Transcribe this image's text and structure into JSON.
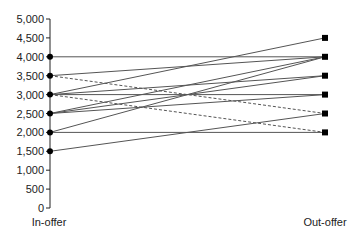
{
  "chart_data": {
    "type": "line",
    "title": "",
    "xlabel": "",
    "ylabel": "",
    "categories": [
      "In-offer",
      "Out-offer"
    ],
    "ylim": [
      0,
      5000
    ],
    "yticks": [
      0,
      500,
      1000,
      1500,
      2000,
      2500,
      3000,
      3500,
      4000,
      4500,
      5000
    ],
    "ytick_labels": [
      "0",
      "500",
      "1,000",
      "1,500",
      "2,000",
      "2,500",
      "3,000",
      "3,500",
      "4,000",
      "4,500",
      "5,000"
    ],
    "grid": false,
    "legend": null,
    "series": [
      {
        "name": "1",
        "values": [
          4000,
          4000
        ],
        "style": "solid"
      },
      {
        "name": "2",
        "values": [
          3500,
          4000
        ],
        "style": "solid"
      },
      {
        "name": "3",
        "values": [
          3500,
          2500
        ],
        "style": "dashed"
      },
      {
        "name": "4",
        "values": [
          3000,
          4500
        ],
        "style": "solid"
      },
      {
        "name": "5",
        "values": [
          3000,
          3500
        ],
        "style": "solid"
      },
      {
        "name": "6",
        "values": [
          3000,
          3000
        ],
        "style": "solid"
      },
      {
        "name": "7",
        "values": [
          3000,
          2000
        ],
        "style": "dashed"
      },
      {
        "name": "8",
        "values": [
          2500,
          4000
        ],
        "style": "solid"
      },
      {
        "name": "9",
        "values": [
          2500,
          3500
        ],
        "style": "solid"
      },
      {
        "name": "10",
        "values": [
          2500,
          3000
        ],
        "style": "solid"
      },
      {
        "name": "11",
        "values": [
          2000,
          4000
        ],
        "style": "solid"
      },
      {
        "name": "12",
        "values": [
          2000,
          2000
        ],
        "style": "solid"
      },
      {
        "name": "13",
        "values": [
          1500,
          2500
        ],
        "style": "solid"
      }
    ],
    "markers": {
      "left": "circle",
      "right": "square"
    }
  }
}
